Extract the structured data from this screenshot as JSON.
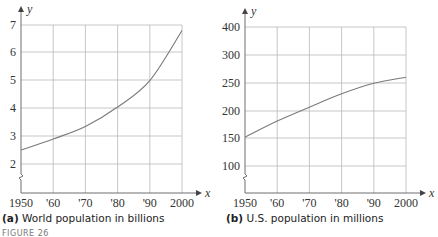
{
  "chart_data": [
    {
      "type": "line",
      "id": "a",
      "title": "World population in billions",
      "caption_prefix": "(a)",
      "xlabel": "x",
      "ylabel": "y",
      "x_ticks": [
        "1950",
        "'60",
        "'70",
        "'80",
        "'90",
        "2000"
      ],
      "y_ticks": [
        "2",
        "3",
        "4",
        "5",
        "6",
        "7"
      ],
      "y_tick_values": [
        2,
        3,
        4,
        5,
        6,
        7
      ],
      "ylim": [
        1,
        7
      ],
      "y_axis_break": true,
      "grid": true,
      "series": [
        {
          "name": "World population (billions)",
          "x": [
            1950,
            1960,
            1970,
            1980,
            1990,
            2000
          ],
          "values": [
            2.5,
            2.9,
            3.35,
            4.05,
            5.0,
            6.8
          ]
        }
      ]
    },
    {
      "type": "line",
      "id": "b",
      "title": "U.S. population in millions",
      "caption_prefix": "(b)",
      "xlabel": "x",
      "ylabel": "y",
      "x_ticks": [
        "1950",
        "'60",
        "'70",
        "'80",
        "'90",
        "2000"
      ],
      "y_ticks": [
        "100",
        "150",
        "200",
        "250",
        "300",
        "400"
      ],
      "y_tick_values": [
        100,
        150,
        200,
        250,
        300,
        400
      ],
      "y_axis_break": true,
      "grid": true,
      "series": [
        {
          "name": "U.S. population (millions)",
          "x": [
            1950,
            1960,
            1970,
            1980,
            1990,
            2000
          ],
          "values": [
            152,
            181,
            206,
            230,
            249,
            260
          ]
        }
      ]
    }
  ],
  "figure_label": "FIGURE 26"
}
